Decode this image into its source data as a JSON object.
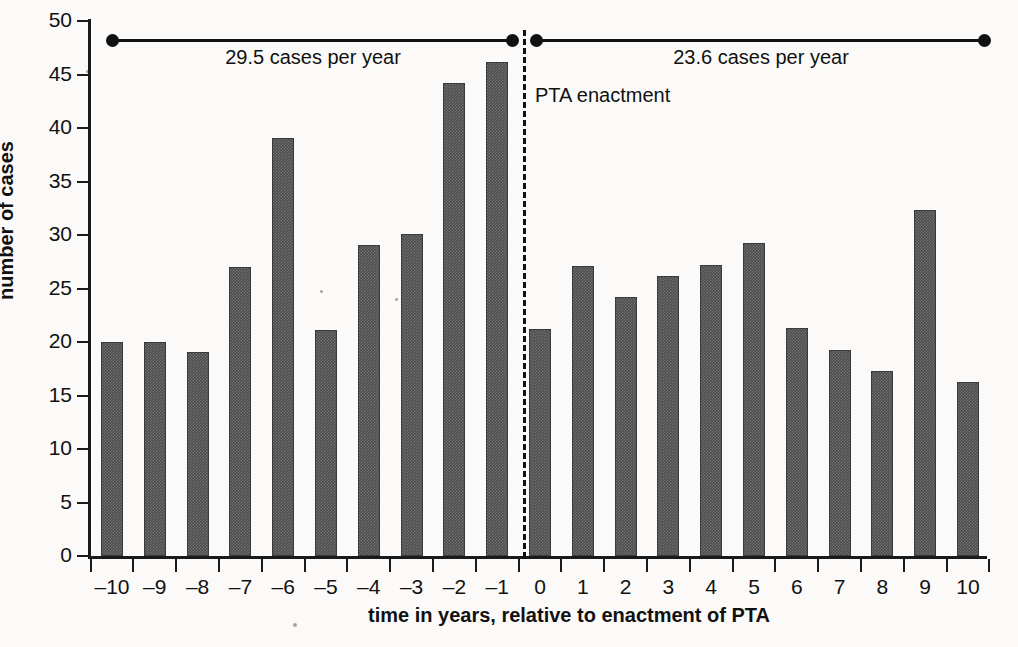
{
  "chart_data": {
    "type": "bar",
    "title": "",
    "xlabel": "time in years, relative to enactment of PTA",
    "ylabel": "number of cases",
    "categories": [
      "–10",
      "–9",
      "–8",
      "–7",
      "–6",
      "–5",
      "–4",
      "–3",
      "–2",
      "–1",
      "0",
      "1",
      "2",
      "3",
      "4",
      "5",
      "6",
      "7",
      "8",
      "9",
      "10"
    ],
    "values": [
      20.0,
      20.0,
      19.1,
      27.0,
      39.1,
      21.1,
      29.1,
      30.1,
      44.2,
      46.2,
      21.2,
      27.1,
      24.2,
      26.2,
      27.2,
      29.3,
      21.3,
      19.3,
      17.3,
      32.3,
      16.3
    ],
    "ylim": [
      0,
      50
    ],
    "yticks": [
      0,
      5,
      10,
      15,
      20,
      25,
      30,
      35,
      40,
      45,
      50
    ],
    "ytick_labels": [
      "0",
      "5",
      "10",
      "15",
      "20",
      "25",
      "30",
      "35",
      "40",
      "45",
      "50"
    ],
    "grid": false,
    "legend": "none",
    "bar_color": "#4d4d4d",
    "annotations": [
      {
        "name": "pre-enactment-rate",
        "label": "29.5 cases per year",
        "span_start_category": "–10",
        "span_end_category": "–1",
        "value": 29.5
      },
      {
        "name": "post-enactment-rate",
        "label": "23.6 cases per year",
        "span_start_category": "0",
        "span_end_category": "10",
        "value": 23.6
      },
      {
        "name": "enactment-divider",
        "label": "PTA enactment",
        "position": "between –1 and 0"
      }
    ]
  }
}
